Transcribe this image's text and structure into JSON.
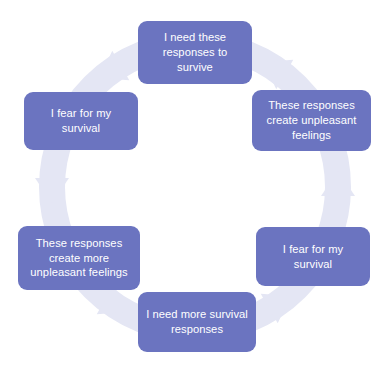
{
  "diagram": {
    "type": "cycle",
    "title": "",
    "colors": {
      "node_fill": "#6b74c0",
      "node_text": "#ffffff",
      "ring_band": "#e4e6f4",
      "background": "#ffffff"
    },
    "ring": {
      "direction": "clockwise",
      "arrowhead_count": 6,
      "style": "thick pale circular band with triangular arrowheads between nodes"
    },
    "nodes": [
      {
        "id": "node-top",
        "position": "top",
        "label": "I need these responses to survive"
      },
      {
        "id": "node-right-up",
        "position": "upper-right",
        "label": "These responses create unpleasant feelings"
      },
      {
        "id": "node-right-dn",
        "position": "lower-right",
        "label": "I fear for my survival"
      },
      {
        "id": "node-bottom",
        "position": "bottom",
        "label": "I need more survival responses"
      },
      {
        "id": "node-left-dn",
        "position": "lower-left",
        "label": "These responses create more unpleasant feelings"
      },
      {
        "id": "node-left-up",
        "position": "upper-left",
        "label": "I fear for my survival"
      }
    ]
  }
}
